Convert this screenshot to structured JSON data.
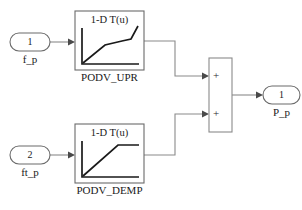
{
  "diagram": {
    "type": "simulink-block-diagram",
    "title": "",
    "background_color": "#ffffff",
    "line_color": "#8a8a8a",
    "plot_color": "#1a1a1a"
  },
  "inports": [
    {
      "id": "inport-1",
      "number": "1",
      "label": "f_p",
      "shape": "rounded-rect"
    },
    {
      "id": "inport-2",
      "number": "2",
      "label": "ft_p",
      "shape": "rounded-rect"
    }
  ],
  "lookup_blocks": [
    {
      "id": "podv-upr",
      "title": "1-D T(u)",
      "caption": "PODV_UPR",
      "curve_shape": "rise-flatten-rise"
    },
    {
      "id": "podv-demp",
      "title": "1-D T(u)",
      "caption": "PODV_DEMP",
      "curve_shape": "linear-rise-saturate"
    }
  ],
  "sum_block": {
    "id": "sum-block",
    "sign_top": "+",
    "sign_bottom": "+",
    "operation": "add"
  },
  "outports": [
    {
      "id": "outport-1",
      "number": "1",
      "label": "P_p",
      "shape": "rounded-rect"
    }
  ],
  "signals": [
    {
      "id": "sig-in1-to-upr",
      "from": "inport-1",
      "to": "podv-upr"
    },
    {
      "id": "sig-in2-to-demp",
      "from": "inport-2",
      "to": "podv-demp"
    },
    {
      "id": "sig-upr-to-sum",
      "from": "podv-upr",
      "to": "sum-block"
    },
    {
      "id": "sig-demp-to-sum",
      "from": "podv-demp",
      "to": "sum-block"
    },
    {
      "id": "sig-sum-to-out",
      "from": "sum-block",
      "to": "outport-1"
    }
  ]
}
